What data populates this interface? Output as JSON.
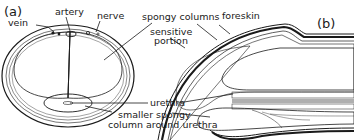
{
  "figure": {
    "panels": [
      {
        "id": "a",
        "label": "(a)",
        "view": "cross-section"
      },
      {
        "id": "b",
        "label": "(b)",
        "view": "longitudinal-section"
      }
    ],
    "labels": {
      "vein": "vein",
      "artery": "artery",
      "nerve": "nerve",
      "spongy_columns": "spongy columns",
      "foreskin": "foreskin",
      "sensitive_portion_line1": "sensitive",
      "sensitive_portion_line2": "portion",
      "urethra": "urethra",
      "smaller_spongy_line1": "smaller spongy",
      "smaller_spongy_line2": "column around urethra"
    },
    "colors": {
      "ink": "#1a1a1a",
      "background": "#ffffff"
    }
  }
}
